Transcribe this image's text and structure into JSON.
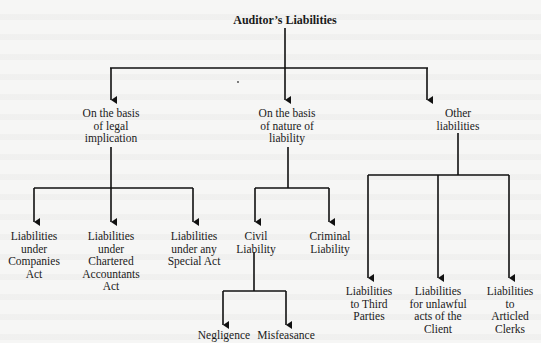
{
  "diagram": {
    "root": {
      "label": "Auditor’s Liabilities"
    },
    "level1": [
      {
        "label": "On the basis\nof legal\nimplication"
      },
      {
        "label": "On the basis\nof nature of\nliability"
      },
      {
        "label": "Other\nliabilities"
      }
    ],
    "legal_children": [
      {
        "label": "Liabilities\nunder\nCompanies\nAct"
      },
      {
        "label": "Liabilities\nunder\nChartered\nAccountants\nAct"
      },
      {
        "label": "Liabilities\nunder any\nSpecial Act"
      }
    ],
    "nature_children": [
      {
        "label": "Civil\nLiability"
      },
      {
        "label": "Criminal\nLiability"
      }
    ],
    "civil_children": [
      {
        "label": "Negligence"
      },
      {
        "label": "Misfeasance"
      }
    ],
    "other_children": [
      {
        "label": "Liabilities\nto Third\nParties"
      },
      {
        "label": "Liabilities\nfor unlawful\nacts of the\nClient"
      },
      {
        "label": "Liabilities\nto Articled\nClerks"
      }
    ],
    "colors": {
      "line": "#111111",
      "background": "#f6f6f5"
    }
  }
}
